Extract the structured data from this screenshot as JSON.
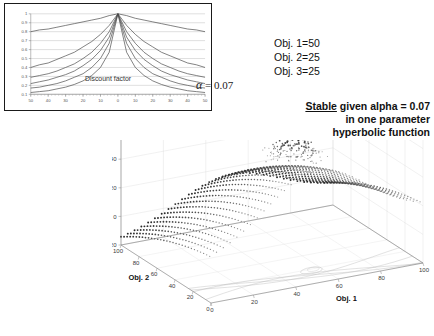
{
  "chart_data": [
    {
      "type": "line",
      "name": "discount-factor-chart",
      "title": "Discount factor",
      "xlabel": "",
      "ylabel": "",
      "xlim": [
        -50,
        50
      ],
      "ylim": [
        0.1,
        1.0
      ],
      "grid": true,
      "legend": "none",
      "annotation": "α = 0.07",
      "xticks": [
        "50",
        "40",
        "30",
        "20",
        "10",
        "0",
        "10",
        "20",
        "30",
        "40",
        "50"
      ],
      "xtick_values": [
        -50,
        -40,
        -30,
        -20,
        -10,
        0,
        10,
        20,
        30,
        40,
        50
      ],
      "yticks": [
        "0.1",
        "0.2",
        "0.3",
        "0.4",
        "0.5",
        "0.6",
        "0.7",
        "0.8",
        "0.9",
        "1"
      ],
      "ytick_values": [
        0.1,
        0.2,
        0.3,
        0.4,
        0.5,
        0.6,
        0.7,
        0.8,
        0.9,
        1.0
      ],
      "x": [
        -50,
        -45,
        -40,
        -35,
        -30,
        -25,
        -20,
        -15,
        -10,
        -5,
        0,
        5,
        10,
        15,
        20,
        25,
        30,
        35,
        40,
        45,
        50
      ],
      "series": [
        {
          "name": "alpha=0.005",
          "values": [
            0.8,
            0.82,
            0.83,
            0.85,
            0.87,
            0.89,
            0.91,
            0.93,
            0.95,
            0.98,
            1.0,
            0.98,
            0.95,
            0.93,
            0.91,
            0.89,
            0.87,
            0.85,
            0.83,
            0.82,
            0.8
          ]
        },
        {
          "name": "alpha=0.03",
          "values": [
            0.4,
            0.43,
            0.45,
            0.49,
            0.53,
            0.57,
            0.63,
            0.69,
            0.77,
            0.87,
            1.0,
            0.87,
            0.77,
            0.69,
            0.63,
            0.57,
            0.53,
            0.49,
            0.45,
            0.43,
            0.4
          ]
        },
        {
          "name": "alpha=0.05",
          "values": [
            0.29,
            0.31,
            0.33,
            0.36,
            0.4,
            0.44,
            0.5,
            0.57,
            0.67,
            0.8,
            1.0,
            0.8,
            0.67,
            0.57,
            0.5,
            0.44,
            0.4,
            0.36,
            0.33,
            0.31,
            0.29
          ]
        },
        {
          "name": "alpha=0.07",
          "values": [
            0.22,
            0.24,
            0.26,
            0.29,
            0.32,
            0.36,
            0.42,
            0.49,
            0.59,
            0.74,
            1.0,
            0.74,
            0.59,
            0.49,
            0.42,
            0.36,
            0.32,
            0.29,
            0.26,
            0.24,
            0.22
          ]
        },
        {
          "name": "alpha=0.10",
          "values": [
            0.17,
            0.18,
            0.2,
            0.22,
            0.25,
            0.29,
            0.33,
            0.4,
            0.5,
            0.67,
            1.0,
            0.67,
            0.5,
            0.4,
            0.33,
            0.29,
            0.25,
            0.22,
            0.2,
            0.18,
            0.17
          ]
        },
        {
          "name": "alpha=0.15",
          "values": [
            0.12,
            0.13,
            0.14,
            0.16,
            0.18,
            0.21,
            0.25,
            0.31,
            0.4,
            0.57,
            1.0,
            0.57,
            0.4,
            0.31,
            0.25,
            0.21,
            0.18,
            0.16,
            0.14,
            0.13,
            0.12
          ]
        }
      ]
    },
    {
      "type": "scatter",
      "name": "utility-surface-3d",
      "title": "",
      "xlabel": "Obj. 1",
      "ylabel": "Obj. 2",
      "zlabel": "Utils",
      "xlim": [
        0,
        100
      ],
      "ylim": [
        0,
        100
      ],
      "zlim": [
        -20,
        80
      ],
      "grid": true,
      "legend": "none",
      "xticks": [
        "0",
        "20",
        "40",
        "60",
        "80",
        "100"
      ],
      "xtick_values": [
        0,
        20,
        40,
        60,
        80,
        100
      ],
      "yticks": [
        "100",
        "80",
        "60",
        "40",
        "20",
        "0"
      ],
      "ytick_values": [
        100,
        80,
        60,
        40,
        20,
        0
      ],
      "zticks": [
        "80",
        "60",
        "40",
        "20",
        "0",
        "-20"
      ],
      "ztick_values": [
        80,
        60,
        40,
        20,
        0,
        -20
      ],
      "highlight_point": {
        "label": "stable-equilibrium-marker",
        "obj1": 50,
        "obj2": 25,
        "utils": 75
      }
    }
  ],
  "inset_chart": {
    "caption": "Discount factor",
    "alpha_symbol": "α",
    "alpha_equation": "= 0.07"
  },
  "annotations": {
    "objective_weights": [
      "Obj. 1=50",
      "Obj. 2=25",
      "Obj. 3=25"
    ],
    "stable_note": {
      "underlined_word": "Stable",
      "line1_rest": " given alpha = 0.07",
      "line2": "in one parameter",
      "line3": "hyperbolic function"
    }
  },
  "surface_axes": {
    "x_title": "Obj. 1",
    "y_title": "Obj. 2",
    "z_title": "Utils",
    "x_ticks": [
      "0",
      "20",
      "40",
      "60",
      "80",
      "100"
    ],
    "y_ticks": [
      "100",
      "80",
      "60",
      "40",
      "20",
      "0"
    ],
    "z_ticks": [
      "80",
      "60",
      "40",
      "20",
      "0",
      "-20"
    ]
  },
  "colors": {
    "background": "#ffffff",
    "text": "#111111",
    "tick": "#555555",
    "grid": "#c9c9c9",
    "curve": "#4a4a4a",
    "marker": "#000000"
  }
}
